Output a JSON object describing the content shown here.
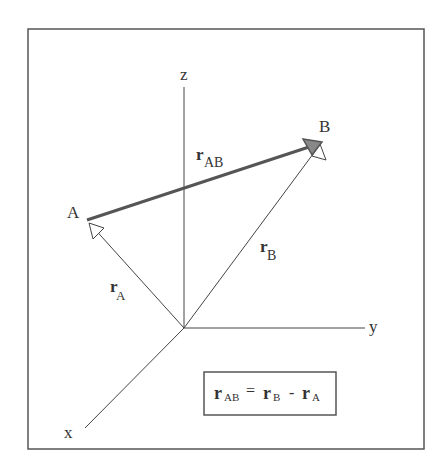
{
  "diagram": {
    "axes": {
      "x": "x",
      "y": "y",
      "z": "z"
    },
    "points": {
      "A": "A",
      "B": "B"
    },
    "vectors": {
      "rA": {
        "main": "r",
        "sub": "A"
      },
      "rB": {
        "main": "r",
        "sub": "B"
      },
      "rAB": {
        "main": "r",
        "sub": "AB"
      }
    },
    "equation": {
      "lhs_main": "r",
      "lhs_sub": "AB",
      "eq": "=",
      "t1_main": "r",
      "t1_sub": "B",
      "minus": "-",
      "t2_main": "r",
      "t2_sub": "A"
    },
    "colors": {
      "line": "#444444",
      "rAB": "#555555",
      "frame": "#555555"
    }
  }
}
